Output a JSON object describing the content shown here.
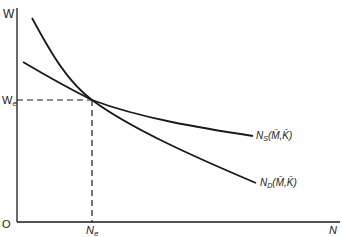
{
  "diagram": {
    "type": "labor-market-equilibrium",
    "axes": {
      "y_label": "W",
      "x_label": "N",
      "origin_label": "O"
    },
    "equilibrium": {
      "wage_label_base": "W",
      "wage_label_sub": "e",
      "employment_label_base": "N",
      "employment_label_sub": "e"
    },
    "curves": [
      {
        "id": "supply",
        "label_base": "N",
        "label_sub": "S",
        "label_args": "(M̄,K̄)"
      },
      {
        "id": "demand",
        "label_base": "N",
        "label_sub": "D",
        "label_args": "(M̄,K̄)"
      }
    ],
    "colors": {
      "line": "#1a1a1a",
      "background": "#ffffff"
    }
  }
}
